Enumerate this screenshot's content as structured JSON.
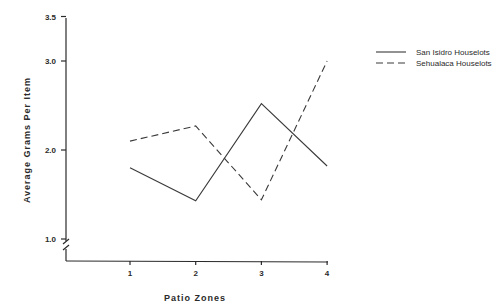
{
  "chart_data": {
    "type": "line",
    "title": "",
    "xlabel": "Patio Zones",
    "ylabel": "Average Grams Per Item",
    "categories": [
      "1",
      "2",
      "3",
      "4"
    ],
    "x": [
      1,
      2,
      3,
      4
    ],
    "yticks": [
      "1.0",
      "2.0",
      "3.0",
      "3.5"
    ],
    "ylim": [
      1.0,
      3.5
    ],
    "axis_break": true,
    "grid": false,
    "legend_position": "upper right, outside plot",
    "series": [
      {
        "name": "San Isidro Houselots",
        "style": "solid",
        "values": [
          1.8,
          1.43,
          2.52,
          1.82
        ]
      },
      {
        "name": "Sehualaca Houselots",
        "style": "dashed",
        "values": [
          2.1,
          2.27,
          1.44,
          3.0
        ]
      }
    ]
  },
  "colors": {
    "line": "#3a3a3a",
    "axis": "#2a2a2a",
    "background": "#ffffff"
  }
}
